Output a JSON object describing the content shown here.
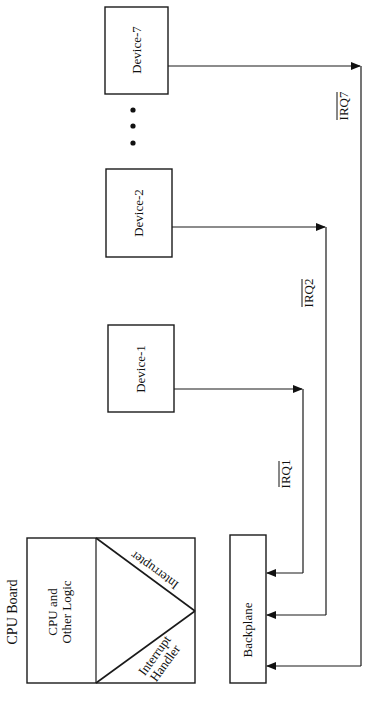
{
  "diagram": {
    "title": "CPU Board",
    "cpu_board": {
      "logic_label_line1": "CPU and",
      "logic_label_line2": "Other Logic",
      "interrupter_label": "Interrupter",
      "handler_label_line1": "Interrupt",
      "handler_label_line2": "Handler"
    },
    "backplane": {
      "label": "Backplane"
    },
    "devices": [
      {
        "label": "Device-1"
      },
      {
        "label": "Device-2"
      },
      {
        "label": "Device-7"
      }
    ],
    "ellipsis": "• • •",
    "signals": [
      {
        "label": "IRQ1",
        "active_low": true,
        "from": "Device-1",
        "to": "Backplane"
      },
      {
        "label": "IRQ2",
        "active_low": true,
        "from": "Device-2",
        "to": "Backplane"
      },
      {
        "label": "IRQ7",
        "active_low": true,
        "from": "Device-7",
        "to": "Backplane"
      }
    ],
    "colors": {
      "line": "#1a1a1a",
      "background": "#ffffff"
    }
  }
}
